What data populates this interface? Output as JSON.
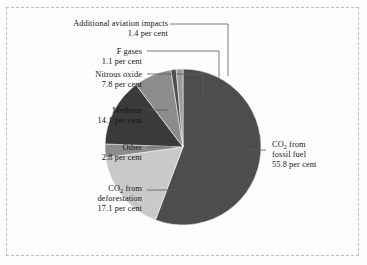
{
  "chart_data": {
    "type": "pie",
    "title": "",
    "subtitle": "",
    "xlabel": "",
    "ylabel": "",
    "unit": "per cent",
    "legend_position": "callout-labels",
    "grid": false,
    "start_angle_deg": 0,
    "direction": "clockwise",
    "categories": [
      "CO2 from fossil fuel",
      "CO2 from deforestation",
      "Other",
      "Methane",
      "Nitrous oxide",
      "F gases",
      "Additional aviation impacts"
    ],
    "values": [
      55.8,
      17.1,
      2.8,
      14.1,
      7.8,
      1.1,
      1.4
    ],
    "total": 100.1,
    "colors": [
      "#4d4d4d",
      "#c9c9c9",
      "#8c8c8c",
      "#3a3a3a",
      "#8c8c8c",
      "#4d4d4d",
      "#9a9a9a"
    ],
    "slices": [
      {
        "name": "CO2 from fossil fuel",
        "value": 55.8,
        "color": "#4d4d4d"
      },
      {
        "name": "CO2 from deforestation",
        "value": 17.1,
        "color": "#c9c9c9"
      },
      {
        "name": "Other",
        "value": 2.8,
        "color": "#8c8c8c"
      },
      {
        "name": "Methane",
        "value": 14.1,
        "color": "#3a3a3a"
      },
      {
        "name": "Nitrous oxide",
        "value": 7.8,
        "color": "#8c8c8c"
      },
      {
        "name": "F gases",
        "value": 1.1,
        "color": "#4d4d4d"
      },
      {
        "name": "Additional aviation impacts",
        "value": 1.4,
        "color": "#9a9a9a"
      }
    ]
  },
  "labels": {
    "aviation": {
      "name_line": "Additional aviation impacts",
      "value_line": "1.4 per cent"
    },
    "fgases": {
      "name_line": "F gases",
      "value_line": "1.1 per cent"
    },
    "nitrous": {
      "name_line": "Nitrous oxide",
      "value_line": "7.8 per cent"
    },
    "methane": {
      "name_line": "Methane",
      "value_line": "14.1 per cent"
    },
    "other": {
      "name_line": "Other",
      "value_line": "2.8 per cent"
    },
    "deforestation": {
      "name_prefix": "CO",
      "name_sub": "2",
      "name_suffix": " from",
      "name_line2": "deforestation",
      "value_line": "17.1 per cent"
    },
    "fossil": {
      "name_prefix": "CO",
      "name_sub": "2",
      "name_suffix": " from",
      "name_line2": "fossil fuel",
      "value_line": "55.8 per cent"
    }
  },
  "style": {
    "frame_color": "#bdbdbd",
    "background": "#fdfdfd",
    "leader_color": "#5a5a5a",
    "text_color": "#161616"
  }
}
